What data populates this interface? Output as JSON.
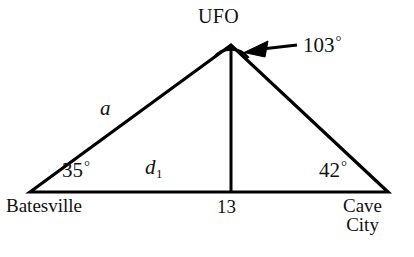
{
  "figure": {
    "type": "geometry-diagram",
    "background_color": "#ffffff",
    "stroke_color": "#000000"
  },
  "labels": {
    "apex": "UFO",
    "apex_angle": "103",
    "degree_symbol": "°",
    "left_vertex": "Batesville",
    "right_vertex_line1": "Cave",
    "right_vertex_line2": "City",
    "left_angle": "35",
    "right_angle": "42",
    "side_a": "a",
    "base_label": "d",
    "base_label_subscript": "1",
    "altitude_label": "13"
  },
  "geometry": {
    "apex": {
      "x": 231,
      "y": 45
    },
    "left_vertex": {
      "x": 30,
      "y": 192
    },
    "right_vertex": {
      "x": 388,
      "y": 192
    },
    "altitude_foot": {
      "x": 231,
      "y": 192
    },
    "arrow_tail": {
      "x": 297,
      "y": 46
    },
    "arrow_head": {
      "x": 247,
      "y": 52
    }
  }
}
